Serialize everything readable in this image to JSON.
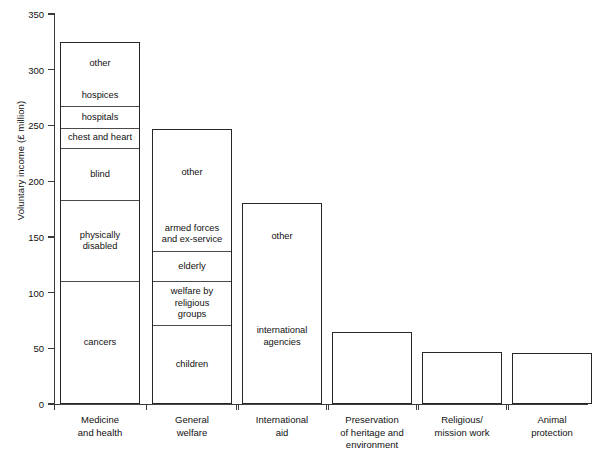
{
  "chart_data": {
    "type": "bar",
    "title": "",
    "subtitle": "",
    "xlabel": "",
    "ylabel": "Voluntary income (£ million)",
    "ylim": [
      0,
      350
    ],
    "yticks": [
      0,
      50,
      100,
      150,
      200,
      250,
      300,
      350
    ],
    "grid": false,
    "legend": "none",
    "stacked": true,
    "categories": [
      "Medicine and health",
      "General welfare",
      "International aid",
      "Preservation of heritage and environment",
      "Religious/ mission work",
      "Animal protection"
    ],
    "totals": [
      325,
      247,
      180,
      65,
      47,
      46
    ],
    "bars": [
      {
        "category": "Medicine and health",
        "label_lines": "Medicine\nand health",
        "total": 325,
        "segments": [
          {
            "name": "cancers",
            "value": 110,
            "cumulative_top": 110
          },
          {
            "name": "physically\ndisabled",
            "value": 73,
            "cumulative_top": 183
          },
          {
            "name": "blind",
            "value": 47,
            "cumulative_top": 230
          },
          {
            "name": "chest and heart",
            "value": 18,
            "cumulative_top": 248
          },
          {
            "name": "hospitals",
            "value": 19,
            "cumulative_top": 267
          },
          {
            "name": "hospices",
            "value": 21,
            "cumulative_top": 288
          },
          {
            "name": "other",
            "value": 37,
            "cumulative_top": 325
          }
        ]
      },
      {
        "category": "General welfare",
        "label_lines": "General\nwelfare",
        "total": 247,
        "segments": [
          {
            "name": "children",
            "value": 71,
            "cumulative_top": 71
          },
          {
            "name": "welfare by\nreligious\ngroups",
            "value": 39,
            "cumulative_top": 110
          },
          {
            "name": "elderly",
            "value": 27,
            "cumulative_top": 137
          },
          {
            "name": "armed forces\nand ex-service",
            "value": 32,
            "cumulative_top": 169
          },
          {
            "name": "other",
            "value": 78,
            "cumulative_top": 247
          }
        ]
      },
      {
        "category": "International aid",
        "label_lines": "International\naid",
        "total": 180,
        "segments": [
          {
            "name": "international\nagencies",
            "value": 122,
            "cumulative_top": 122
          },
          {
            "name": "other",
            "value": 58,
            "cumulative_top": 180
          }
        ]
      },
      {
        "category": "Preservation of heritage and environment",
        "label_lines": "Preservation\nof heritage and\nenvironment",
        "total": 65,
        "segments": [
          {
            "name": "",
            "value": 65,
            "cumulative_top": 65
          }
        ]
      },
      {
        "category": "Religious/ mission work",
        "label_lines": "Religious/\nmission work",
        "total": 47,
        "segments": [
          {
            "name": "",
            "value": 47,
            "cumulative_top": 47
          }
        ]
      },
      {
        "category": "Animal protection",
        "label_lines": "Animal\nprotection",
        "total": 46,
        "segments": [
          {
            "name": "",
            "value": 46,
            "cumulative_top": 46
          }
        ]
      }
    ]
  },
  "colors": {
    "axis": "#3a3a3a",
    "bar_outline": "#262626",
    "segment_divider": "#4a4a4a",
    "background": "#ffffff",
    "text": "#111111"
  },
  "geometry": {
    "plot_left": 54,
    "plot_right": 588,
    "y_zero_px": 404,
    "y_max_px": 14,
    "bar_x": [
      60,
      152,
      242,
      332,
      422,
      512
    ],
    "bar_width": 80
  }
}
